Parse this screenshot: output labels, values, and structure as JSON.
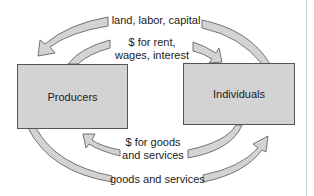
{
  "diagram": {
    "type": "circular-flow",
    "nodes": [
      {
        "id": "producers",
        "label": "Producers"
      },
      {
        "id": "individuals",
        "label": "Individuals"
      }
    ],
    "flows": [
      {
        "id": "factors",
        "label": "land, labor, capital",
        "from": "individuals",
        "to": "producers"
      },
      {
        "id": "factor-payments",
        "label_line1": "$ for rent,",
        "label_line2": "wages, interest",
        "from": "producers",
        "to": "individuals"
      },
      {
        "id": "spending",
        "label_line1": "$ for goods",
        "label_line2": "and services",
        "from": "individuals",
        "to": "producers"
      },
      {
        "id": "goods",
        "label": "goods and services",
        "from": "producers",
        "to": "individuals"
      }
    ],
    "colors": {
      "box_fill": "#d3d3d3",
      "arrow_fill": "#d3d3d3",
      "outline": "#555555"
    }
  }
}
